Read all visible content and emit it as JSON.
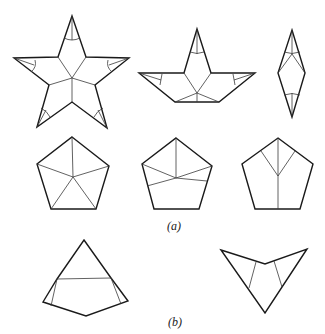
{
  "figure": {
    "part_a": {
      "label": "(a)",
      "top_row": [
        "five-pointed star folding pattern",
        "partially folded star",
        "folded diamond"
      ],
      "bottom_row": [
        "pentagon with five radial creases",
        "pentagon with asymmetric creases",
        "pentagon with Y-shaped crease"
      ]
    },
    "part_b": {
      "label": "(b)",
      "shapes": [
        "kite with horizontal crease",
        "V-shaped arrowhead with two creases"
      ]
    },
    "colors": {
      "line": "#1a1a1a",
      "background": "#ffffff"
    }
  }
}
